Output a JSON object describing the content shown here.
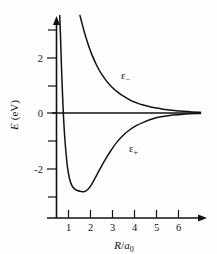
{
  "figure": {
    "background_color": "#fefefe",
    "ink_color": "#111111"
  },
  "chart_data": {
    "type": "line",
    "title": "",
    "subtitle": "",
    "xlabel": "R/a_0",
    "xlabel_parts": {
      "numerator": "R",
      "slash": "/",
      "denominator": "a",
      "subscript": "0"
    },
    "ylabel": "E (eV)",
    "ylabel_parts": {
      "symbol": "E",
      "units": "(eV)"
    },
    "xlim": [
      0,
      7.1
    ],
    "ylim": [
      -4.0,
      3.6
    ],
    "grid": false,
    "legend_position": "inline-annotation",
    "x_major_ticks": [
      1,
      2,
      3,
      4,
      5,
      6
    ],
    "x_tick_labels": [
      "1",
      "2",
      "3",
      "4",
      "5",
      "6"
    ],
    "y_major_ticks": [
      2,
      0,
      -2
    ],
    "y_tick_labels": [
      "2",
      "0",
      "-2"
    ],
    "y_minor_ticks": [
      3,
      1,
      -1,
      -3
    ],
    "annotations": [
      {
        "text": "ε",
        "subscript": "−",
        "x": 3.4,
        "y": 1.2,
        "series": "epsilon_minus"
      },
      {
        "text": "ε",
        "subscript": "+",
        "x": 3.8,
        "y": -1.25,
        "series": "epsilon_plus"
      }
    ],
    "series": [
      {
        "name": "ε−",
        "label": "epsilon_minus",
        "description": "antibonding antisymmetric state, repulsive, decays to zero",
        "x": [
          1.52,
          1.6,
          1.7,
          1.8,
          1.95,
          2.1,
          2.3,
          2.5,
          2.75,
          3.0,
          3.25,
          3.5,
          3.8,
          4.1,
          4.4,
          4.7,
          5.0,
          5.3,
          5.6,
          5.9,
          6.2,
          6.6,
          7.0
        ],
        "y": [
          3.55,
          3.3,
          3.0,
          2.73,
          2.36,
          2.05,
          1.7,
          1.42,
          1.14,
          0.92,
          0.75,
          0.61,
          0.47,
          0.37,
          0.29,
          0.23,
          0.18,
          0.14,
          0.11,
          0.08,
          0.06,
          0.04,
          0.03
        ]
      },
      {
        "name": "ε+",
        "label": "epsilon_plus",
        "description": "bonding symmetric state, potential well with minimum near R/a0 = 1.7",
        "x": [
          0.6,
          0.64,
          0.68,
          0.72,
          0.78,
          0.85,
          0.95,
          1.05,
          1.15,
          1.25,
          1.4,
          1.55,
          1.7,
          1.85,
          2.0,
          2.2,
          2.4,
          2.65,
          2.9,
          3.2,
          3.5,
          3.8,
          4.1,
          4.4,
          4.8,
          5.2,
          5.6,
          6.0,
          6.5,
          7.0
        ],
        "y": [
          3.55,
          2.7,
          1.7,
          0.85,
          -0.25,
          -1.1,
          -1.95,
          -2.4,
          -2.63,
          -2.74,
          -2.82,
          -2.85,
          -2.86,
          -2.8,
          -2.66,
          -2.38,
          -2.08,
          -1.72,
          -1.4,
          -1.06,
          -0.8,
          -0.6,
          -0.45,
          -0.34,
          -0.22,
          -0.14,
          -0.09,
          -0.06,
          -0.03,
          -0.02
        ]
      }
    ],
    "zero_line": {
      "y": 0,
      "x_from": 0.28,
      "x_to": 7.1
    },
    "minimum": {
      "series": "ε+",
      "x": 1.7,
      "y": -2.86
    }
  }
}
